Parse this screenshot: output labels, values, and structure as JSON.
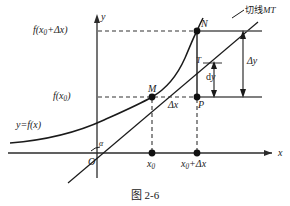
{
  "figure": {
    "caption": "图 2-6",
    "axes": {
      "x_axis_label": "x",
      "y_axis_label": "y",
      "origin_label": "O",
      "angle_label": "α"
    },
    "curve_label": "y=f(x)",
    "tangent_label_cjk": "切线",
    "tangent_label_points": "MT",
    "y_ticks": [
      {
        "id": "y-upper",
        "prefix": "f(x",
        "sub": "0",
        "suffix": "+Δx)"
      },
      {
        "id": "y-lower",
        "prefix": "f(x",
        "sub": "0",
        "suffix": ")"
      }
    ],
    "x_ticks": [
      {
        "id": "x0",
        "prefix": "x",
        "sub": "0",
        "suffix": ""
      },
      {
        "id": "x0dx",
        "prefix": "x",
        "sub": "0",
        "suffix": "+Δx"
      }
    ],
    "points": [
      {
        "id": "M",
        "label": "M"
      },
      {
        "id": "N",
        "label": "N"
      },
      {
        "id": "P",
        "label": "P"
      },
      {
        "id": "T",
        "label": "T"
      }
    ],
    "increments": {
      "delta_x": "Δx",
      "delta_y": "Δy",
      "dy_prefix": "d",
      "dy_var": "y"
    },
    "colors": {
      "ink": "#1a1a1a",
      "line": "#2b2b2b",
      "dash": "#333333",
      "background": "#ffffff"
    }
  }
}
